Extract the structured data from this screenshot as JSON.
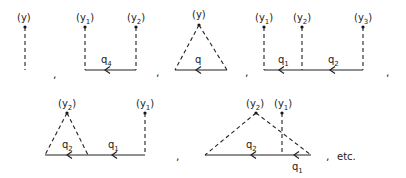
{
  "diagrams": [
    {
      "id": "d1",
      "labels": {
        "y": "(y)"
      }
    },
    {
      "id": "d2",
      "labels": {
        "y1_base": "(y",
        "y1_sub": "1",
        "y2_base": "(y",
        "y2_sub": "2",
        "close": ")",
        "q": "q",
        "q_sub": "4"
      }
    },
    {
      "id": "d3",
      "labels": {
        "y": "(y)",
        "q": "q"
      }
    },
    {
      "id": "d4",
      "labels": {
        "y1_base": "(y",
        "y1_sub": "1",
        "y2_base": "(y",
        "y2_sub": "2",
        "y3_base": "(y",
        "y3_sub": "3",
        "close": ")",
        "q1": "q",
        "q1_sub": "1",
        "q2": "q",
        "q2_sub": "2"
      }
    },
    {
      "id": "d5",
      "labels": {
        "y2_base": "(y",
        "y2_sub": "2",
        "y1_base": "(y",
        "y1_sub": "1",
        "close": ")",
        "q2": "q",
        "q2_sub": "2",
        "q1": "q",
        "q1_sub": "1"
      }
    },
    {
      "id": "d6",
      "labels": {
        "y2_base": "(y",
        "y2_sub": "2",
        "y1_base": "(y",
        "y1_sub": "1",
        "close": ")",
        "q2": "q",
        "q2_sub": "2",
        "q1": "q",
        "q1_sub": "1"
      }
    }
  ],
  "separators": {
    "comma": ",",
    "etc": "etc."
  }
}
